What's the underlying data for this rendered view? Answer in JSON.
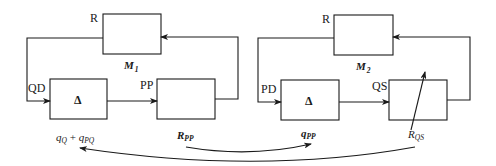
{
  "diagram": {
    "left_loop": {
      "top_block": {
        "port_label": "R",
        "name_label": "M",
        "name_subscript": "1"
      },
      "delta_block": {
        "symbol": "Δ",
        "input_label": "QD"
      },
      "right_block": {
        "input_label": "PP"
      },
      "bottom_labels": {
        "under_delta": {
          "base1": "q",
          "sub1": "Q",
          "op": " + ",
          "base2": "q",
          "sub2": "PQ"
        },
        "under_right": {
          "base": "R",
          "sub": "PP"
        }
      }
    },
    "right_loop": {
      "top_block": {
        "port_label": "R",
        "name_label": "M",
        "name_subscript": "2"
      },
      "delta_block": {
        "symbol": "Δ",
        "input_label": "PD"
      },
      "right_block": {
        "input_label": "QS",
        "has_variable_arrow": true
      },
      "bottom_labels": {
        "under_delta": {
          "base": "q",
          "sub": "PP"
        },
        "under_right": {
          "base": "R",
          "sub": "QS"
        }
      }
    },
    "cross_arrows": [
      {
        "from": "R_PP",
        "to": "q_PP"
      },
      {
        "from": "R_QS",
        "to": "q_Q + q_PQ"
      }
    ],
    "colors": {
      "stroke": "#1a1a1a",
      "background": "#ffffff"
    }
  }
}
